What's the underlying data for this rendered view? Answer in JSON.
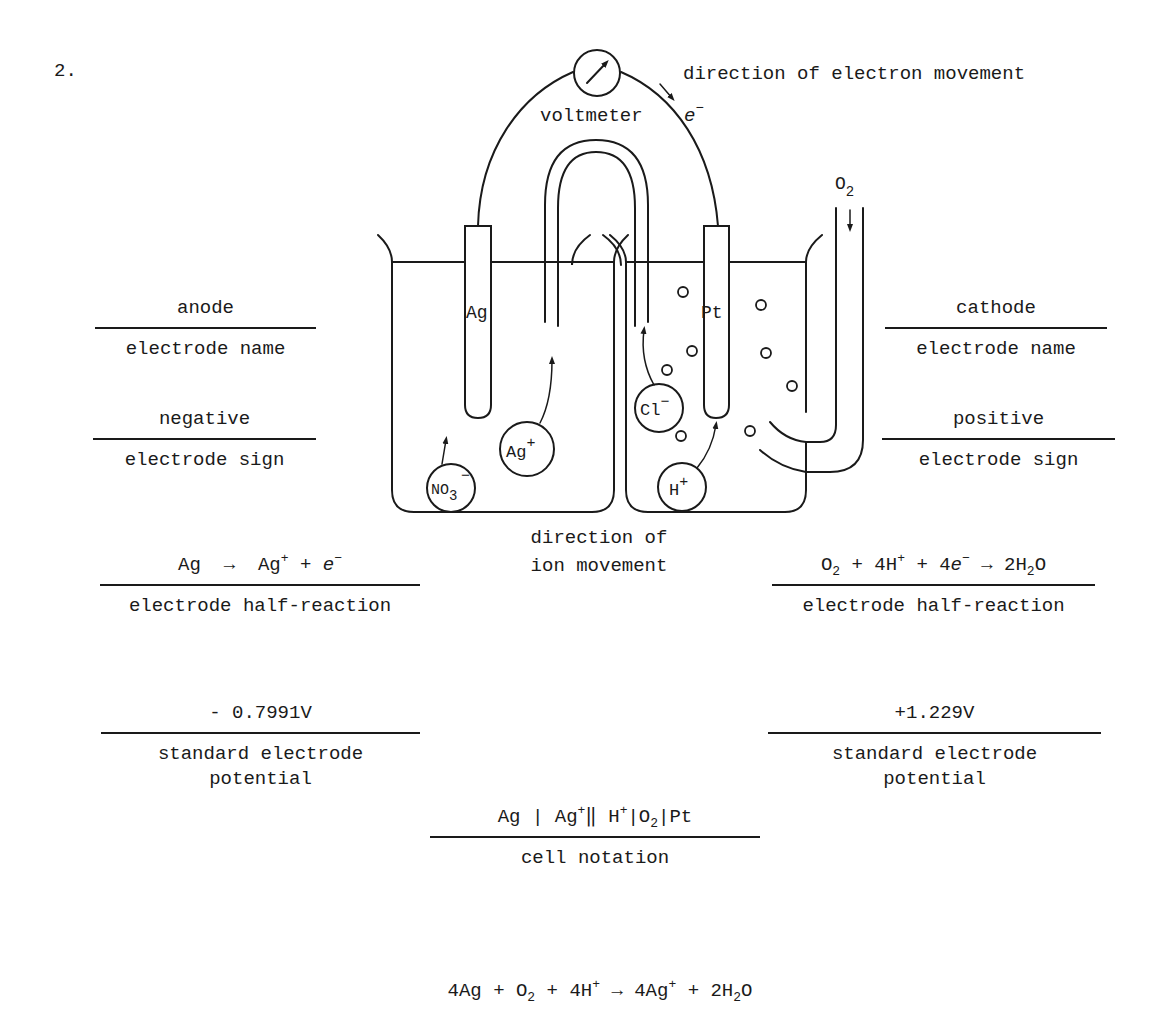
{
  "problem_number": "2.",
  "diagram": {
    "voltmeter_label": "voltmeter",
    "electron_symbol": "e",
    "electron_charge": "−",
    "electron_direction_label": "direction of electron movement",
    "ion_direction_label_line1": "direction of",
    "ion_direction_label_line2": "ion movement",
    "left_electrode": "Ag",
    "right_electrode": "Pt",
    "gas_inlet": {
      "base": "O",
      "sub": "2"
    },
    "ions": {
      "nitrate": {
        "base": "NO",
        "sub": "3",
        "charge": "−"
      },
      "silver": {
        "base": "Ag",
        "charge": "+"
      },
      "chloride": {
        "base": "Cl",
        "charge": "−"
      },
      "hydrogen": {
        "base": "H",
        "charge": "+"
      }
    }
  },
  "left": {
    "electrode_name": {
      "value": "anode",
      "label": "electrode name"
    },
    "electrode_sign": {
      "value": "negative",
      "label": "electrode sign"
    },
    "half_reaction": {
      "value": {
        "r1": "Ag",
        "arrow": "→",
        "p1": "Ag",
        "p1_sup": "+",
        "plus": "+",
        "p2": "e",
        "p2_sup": "−"
      },
      "label": "electrode half-reaction"
    },
    "potential": {
      "value": "- 0.7991V",
      "label": "standard electrode\npotential"
    }
  },
  "right": {
    "electrode_name": {
      "value": "cathode",
      "label": "electrode name"
    },
    "electrode_sign": {
      "value": "positive",
      "label": "electrode sign"
    },
    "half_reaction": {
      "value": {
        "r1": "O",
        "r1_sub": "2",
        "plus1": "+",
        "r2": "4H",
        "r2_sup": "+",
        "plus2": "+",
        "r3": "4e",
        "r3_sup": "−",
        "arrow": "→",
        "p1": "2H",
        "p1_sub": "2",
        "p1_tail": "O"
      },
      "label": "electrode half-reaction"
    },
    "potential": {
      "value": "+1.229V",
      "label": "standard electrode\npotential"
    }
  },
  "cell_notation": {
    "value": {
      "a": "Ag",
      "bar1": "|",
      "b": "Ag",
      "b_sup": "+",
      "salt_bridge": "‖",
      "c": "H",
      "c_sup": "+",
      "bar2": "|",
      "d": "O",
      "d_sub": "2",
      "bar3": "|",
      "e": "Pt"
    },
    "label": "cell notation"
  },
  "overall_reaction": {
    "t1": "4Ag",
    "plus1": "+",
    "t2": "O",
    "t2_sub": "2",
    "plus2": "+",
    "t3": "4H",
    "t3_sup": "+",
    "arrow": "→",
    "t4": "4Ag",
    "t4_sup": "+",
    "plus3": "+",
    "t5": "2H",
    "t5_sub": "2",
    "t5_tail": "O"
  }
}
